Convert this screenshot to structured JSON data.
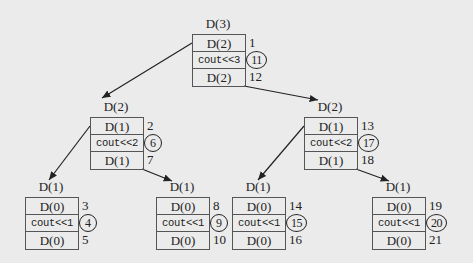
{
  "diagram": {
    "nodes": [
      {
        "id": "root",
        "title": "D(3)",
        "x": 192,
        "y": 34,
        "rows": [
          "D(2)",
          "cout<<3",
          "D(2)"
        ],
        "nums": [
          "1",
          "11",
          "12"
        ]
      },
      {
        "id": "l",
        "title": "D(2)",
        "x": 90,
        "y": 117,
        "rows": [
          "D(1)",
          "cout<<2",
          "D(1)"
        ],
        "nums": [
          "2",
          "6",
          "7"
        ]
      },
      {
        "id": "r",
        "title": "D(2)",
        "x": 304,
        "y": 117,
        "rows": [
          "D(1)",
          "cout<<2",
          "D(1)"
        ],
        "nums": [
          "13",
          "17",
          "18"
        ]
      },
      {
        "id": "ll",
        "title": "D(1)",
        "x": 25,
        "y": 197,
        "rows": [
          "D(0)",
          "cout<<1",
          "D(0)"
        ],
        "nums": [
          "3",
          "4",
          "5"
        ]
      },
      {
        "id": "lr",
        "title": "D(1)",
        "x": 156,
        "y": 197,
        "rows": [
          "D(0)",
          "cout<<1",
          "D(0)"
        ],
        "nums": [
          "8",
          "9",
          "10"
        ]
      },
      {
        "id": "rl",
        "title": "D(1)",
        "x": 232,
        "y": 197,
        "rows": [
          "D(0)",
          "cout<<1",
          "D(0)"
        ],
        "nums": [
          "14",
          "15",
          "16"
        ]
      },
      {
        "id": "rr",
        "title": "D(1)",
        "x": 372,
        "y": 197,
        "rows": [
          "D(0)",
          "cout<<1",
          "D(0)"
        ],
        "nums": [
          "19",
          "20",
          "21"
        ]
      }
    ],
    "edges": [
      [
        "root",
        "l"
      ],
      [
        "root",
        "r"
      ],
      [
        "l",
        "ll"
      ],
      [
        "l",
        "lr"
      ],
      [
        "r",
        "rl"
      ],
      [
        "r",
        "rr"
      ]
    ]
  }
}
